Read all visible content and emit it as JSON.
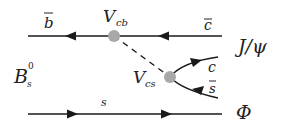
{
  "diagram": {
    "type": "feynman",
    "initial_state": {
      "label": "B",
      "subscript": "s",
      "superscript": "0"
    },
    "top_line": {
      "label": "b",
      "bar": true,
      "direction": "left"
    },
    "top_right_label": {
      "label": "c",
      "bar": true
    },
    "vertex_top": {
      "label": "V",
      "subscript": "cb"
    },
    "vertex_bottom": {
      "label": "V",
      "subscript": "cs"
    },
    "branch_upper": {
      "label": "c"
    },
    "branch_lower": {
      "label": "s",
      "bar": true
    },
    "spectator": {
      "label": "s",
      "direction": "right"
    },
    "final_states": [
      {
        "label": "J/ψ"
      },
      {
        "label": "Φ"
      }
    ],
    "colors": {
      "line": "#1a1a1a",
      "vertex": "#a8a8a8"
    }
  }
}
